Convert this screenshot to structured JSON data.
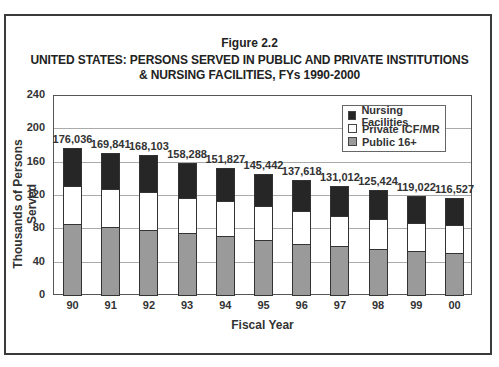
{
  "figure_label": "Figure 2.2",
  "title_line1": "UNITED STATES: PERSONS SERVED IN PUBLIC AND PRIVATE INSTITUTIONS",
  "title_line2": "& NURSING FACILITIES, FYs 1990-2000",
  "colors": {
    "nursing": "#262626",
    "private": "#ffffff",
    "public": "#9a9a9a"
  },
  "chart_data": {
    "type": "bar",
    "stacked": true,
    "xlabel": "Fiscal Year",
    "ylabel": "Thousands of Persons Served",
    "ylim": [
      0,
      240
    ],
    "yticks": [
      0,
      40,
      80,
      120,
      160,
      200,
      240
    ],
    "grid": true,
    "legend_position": "upper right",
    "categories": [
      "90",
      "91",
      "92",
      "93",
      "94",
      "95",
      "96",
      "97",
      "98",
      "99",
      "00"
    ],
    "totals": [
      176036,
      169841,
      168103,
      158288,
      151827,
      145442,
      137618,
      131012,
      125424,
      119022,
      116527
    ],
    "total_labels": [
      "176,036",
      "169,841",
      "168,103",
      "158,288",
      "151,827",
      "145,442",
      "137,618",
      "131,012",
      "125,424",
      "119,022",
      "116,527"
    ],
    "series": [
      {
        "name": "Public 16+",
        "values": [
          85.6,
          81.6,
          78.4,
          74.4,
          70.4,
          65.7,
          61.7,
          58.5,
          55.7,
          52.5,
          50.5
        ]
      },
      {
        "name": "Private ICF/MR",
        "values": [
          45.4,
          45.8,
          45.6,
          42.2,
          41.8,
          40.6,
          38.6,
          36.7,
          35.3,
          33.8,
          33.9
        ]
      },
      {
        "name": "Nursing Facilities",
        "values": [
          45.0,
          42.4,
          44.1,
          41.7,
          39.6,
          39.1,
          37.3,
          35.8,
          34.4,
          32.7,
          32.1
        ]
      }
    ],
    "legend": [
      "Nursing Facilities",
      "Private ICF/MR",
      "Public 16+"
    ]
  }
}
